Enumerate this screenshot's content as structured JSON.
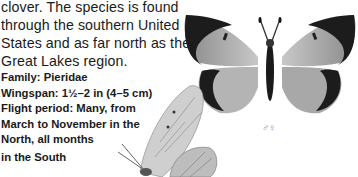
{
  "description_lines": [
    "clover. The species is found",
    "through the southern United",
    "States and as far north as the",
    "Great Lakes region."
  ],
  "facts": {
    "family": "Family: Pieridae",
    "wingspan": "Wingspan: 1½–2 in (4–5 cm)",
    "flight_lines": [
      "Flight period: Many, from",
      "March to November in the",
      "North, all months",
      "in the South"
    ]
  },
  "illustrations": {
    "upper_label": "butterfly-dorsal-view",
    "lower_label": "butterfly-side-view",
    "sex_symbols": "♂♀"
  }
}
